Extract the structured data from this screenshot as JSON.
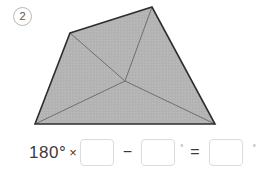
{
  "problem": {
    "number": "2"
  },
  "figure": {
    "name": "quadrilateral-with-interior-point",
    "fill_color": "#b3b3b3",
    "outline_color": "#2e2e2e",
    "diagonal_color": "#6b6b6b",
    "vertices": [
      {
        "label": "top-left",
        "x": 70,
        "y": 33
      },
      {
        "label": "top-right",
        "x": 152,
        "y": 7
      },
      {
        "label": "bottom-right",
        "x": 215,
        "y": 124
      },
      {
        "label": "bottom-left",
        "x": 35,
        "y": 124
      }
    ],
    "interior_point": {
      "label": "interior",
      "x": 125,
      "y": 81
    }
  },
  "equation": {
    "leading_value": "180",
    "leading_degree": "°",
    "times_symbol": "×",
    "box1_value": "",
    "minus_symbol": "−",
    "box2_value": "",
    "degree_symbol_after_box2": "°",
    "equals_symbol": "=",
    "box3_value": "",
    "degree_symbol_after_box3": "°",
    "box_placeholder": ""
  }
}
